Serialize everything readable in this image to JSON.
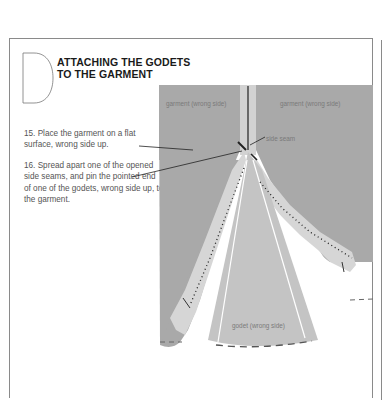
{
  "section": {
    "letter": "D",
    "title_line1": "ATTACHING THE GODETS",
    "title_line2": "TO THE GARMENT"
  },
  "steps": [
    {
      "number": "15",
      "text": "15. Place the garment on a flat surface, wrong side up."
    },
    {
      "number": "16",
      "text": "16. Spread apart one of the opened side seams, and pin the pointed end of one of the godets, wrong side up, to the garment."
    }
  ],
  "illustration": {
    "labels": {
      "garment_left": "garment (wrong side)",
      "garment_right": "garment (wrong side)",
      "side_seam": "side seam",
      "godet": "godet (wrong side)"
    },
    "colors": {
      "garment": "#a9a9a9",
      "seam_allowance": "#d2d2d2",
      "godet": "#c4c4c4",
      "line": "#222222"
    }
  }
}
